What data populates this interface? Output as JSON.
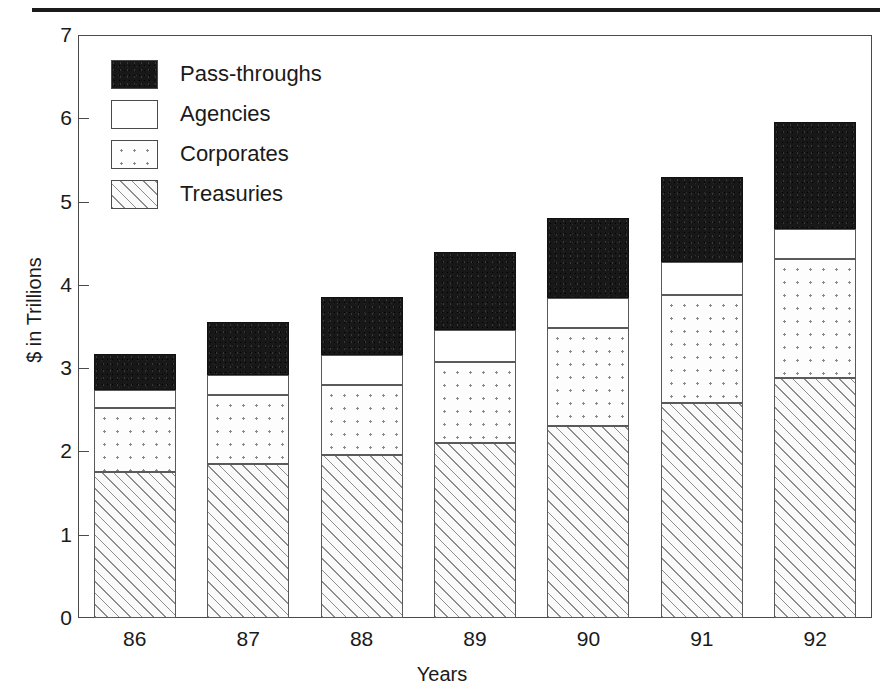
{
  "chart_data": {
    "type": "bar",
    "subtype": "stacked-bar",
    "title": "",
    "xlabel": "Years",
    "ylabel": "$ in Trillions",
    "categories": [
      "86",
      "87",
      "88",
      "89",
      "90",
      "91",
      "92"
    ],
    "ylim": [
      0,
      7
    ],
    "y_ticks": [
      0,
      1,
      2,
      3,
      4,
      5,
      6,
      7
    ],
    "y_tick_labels": [
      "0",
      "1",
      "2",
      "3",
      "4",
      "5",
      "6",
      "7"
    ],
    "grid": false,
    "legend_position": "upper-left-inside",
    "stack_order_bottom_to_top": [
      "Treasuries",
      "Corporates",
      "Agencies",
      "Pass-throughs"
    ],
    "series": [
      {
        "name": "Treasuries",
        "fill": "diagonal-hatch",
        "values": [
          1.75,
          1.85,
          1.96,
          2.1,
          2.3,
          2.58,
          2.88
        ]
      },
      {
        "name": "Corporates",
        "fill": "dotted",
        "values": [
          0.77,
          0.83,
          0.84,
          0.97,
          1.18,
          1.3,
          1.43
        ]
      },
      {
        "name": "Agencies",
        "fill": "white",
        "values": [
          0.22,
          0.24,
          0.36,
          0.39,
          0.36,
          0.39,
          0.36
        ]
      },
      {
        "name": "Pass-throughs",
        "fill": "solid-black",
        "values": [
          0.43,
          0.63,
          0.7,
          0.94,
          0.96,
          1.03,
          1.29
        ]
      }
    ],
    "totals": [
      3.17,
      3.55,
      3.86,
      4.4,
      4.8,
      5.3,
      5.96
    ],
    "cumulative_tops": {
      "Treasuries": [
        1.75,
        1.85,
        1.96,
        2.1,
        2.3,
        2.58,
        2.88
      ],
      "Corporates": [
        2.52,
        2.68,
        2.8,
        3.07,
        3.48,
        3.88,
        4.31
      ],
      "Agencies": [
        2.74,
        2.92,
        3.16,
        3.46,
        3.84,
        4.27,
        4.67
      ],
      "Pass-throughs": [
        3.17,
        3.55,
        3.86,
        4.4,
        4.8,
        5.3,
        5.96
      ]
    }
  },
  "legend": {
    "items": [
      {
        "label": "Pass-throughs",
        "swatch": "solid-black-swatch"
      },
      {
        "label": "Agencies",
        "swatch": "white-swatch"
      },
      {
        "label": "Corporates",
        "swatch": "dotted-swatch"
      },
      {
        "label": "Treasuries",
        "swatch": "hatched-swatch"
      }
    ]
  },
  "colors": {
    "axis": "#4a4a4a",
    "text": "#1a1a1a",
    "pass_throughs": "#181818",
    "agencies": "#ffffff",
    "corporates": "#fdfdfd",
    "treasuries": "#f4f4f4",
    "rule": "#1b1b1b"
  }
}
